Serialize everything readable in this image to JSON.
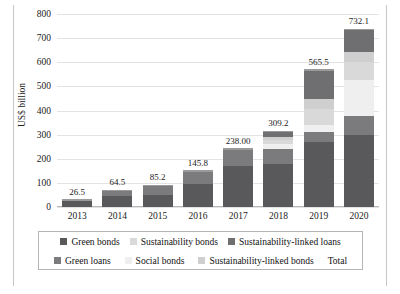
{
  "chart_data": {
    "type": "bar",
    "stacked": true,
    "title": "",
    "xlabel": "",
    "ylabel": "US$ billion",
    "ylim": [
      0,
      800
    ],
    "ytick_labels": [
      "0",
      "100",
      "200",
      "300",
      "400",
      "500",
      "600",
      "700",
      "800"
    ],
    "ytick_values": [
      0,
      100,
      200,
      300,
      400,
      500,
      600,
      700,
      800
    ],
    "grid": true,
    "legend_position": "bottom",
    "categories": [
      "2013",
      "2014",
      "2015",
      "2016",
      "2017",
      "2018",
      "2019",
      "2020"
    ],
    "data_labels": [
      "26.5",
      "64.5",
      "85.2",
      "145.8",
      "238.00",
      "309.2",
      "565.5",
      "732.1"
    ],
    "totals": [
      26.5,
      64.5,
      85.2,
      145.8,
      238.0,
      309.2,
      565.5,
      732.1
    ],
    "series": [
      {
        "name": "Green bonds",
        "color": "#59595b",
        "values": [
          26.5,
          47.0,
          50.0,
          95.0,
          168.0,
          180.0,
          271.0,
          297.0
        ]
      },
      {
        "name": "Green loans",
        "color": "#7b7b7d",
        "values": [
          0.0,
          17.5,
          35.2,
          50.8,
          70.0,
          60.0,
          41.0,
          80.0
        ]
      },
      {
        "name": "Social bonds",
        "color": "#efefef",
        "values": [
          0.0,
          0.0,
          0.0,
          0.0,
          0.0,
          19.2,
          28.0,
          148.0
        ]
      },
      {
        "name": "Sustainability bonds",
        "color": "#d9d9d9",
        "values": [
          0.0,
          0.0,
          0.0,
          0.0,
          0.0,
          20.0,
          68.0,
          77.1
        ]
      },
      {
        "name": "Sustainability-linked bonds",
        "color": "#cfcfcf",
        "values": [
          0.0,
          0.0,
          0.0,
          0.0,
          0.0,
          10.0,
          40.0,
          40.0
        ]
      },
      {
        "name": "Sustainability-linked loans",
        "color": "#6f6f71",
        "values": [
          0.0,
          0.0,
          0.0,
          0.0,
          0.0,
          20.0,
          117.5,
          90.0
        ]
      }
    ],
    "legend": {
      "row1": [
        {
          "label": "Green bonds",
          "color": "#59595b",
          "kind": "swatch"
        },
        {
          "label": "Sustainability bonds",
          "color": "#d9d9d9",
          "kind": "swatch"
        },
        {
          "label": "Sustainability-linked loans",
          "color": "#6f6f71",
          "kind": "swatch"
        }
      ],
      "row2": [
        {
          "label": "Green loans",
          "color": "#7b7b7d",
          "kind": "swatch"
        },
        {
          "label": "Social bonds",
          "color": "#efefef",
          "kind": "swatch"
        },
        {
          "label": "Sustainability-linked bonds",
          "color": "#cfcfcf",
          "kind": "swatch"
        },
        {
          "label": "Total",
          "color": "#9a9a9a",
          "kind": "line"
        }
      ]
    }
  }
}
